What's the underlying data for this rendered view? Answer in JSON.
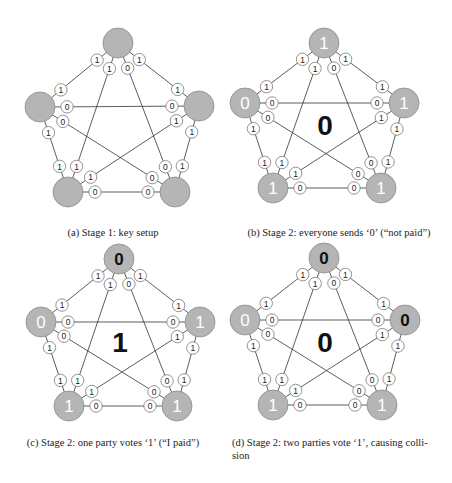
{
  "figure": {
    "node_fill": "#b5b5b5",
    "node_stroke": "#8a8a8a",
    "label_fill": "#ffffff",
    "label_stroke": "#777777",
    "line_color": "#333333",
    "edges": [
      {
        "from": "T",
        "to": "L",
        "label_from": "1",
        "label_to": "1"
      },
      {
        "from": "T",
        "to": "R",
        "label_from": "1",
        "label_to": "1"
      },
      {
        "from": "T",
        "to": "BL",
        "label_from": "1",
        "label_to": "1"
      },
      {
        "from": "T",
        "to": "BR",
        "label_from": "0",
        "label_to": "0"
      },
      {
        "from": "L",
        "to": "R",
        "label_from": "0",
        "label_to": "0"
      },
      {
        "from": "L",
        "to": "BL",
        "label_from": "1",
        "label_to": "1"
      },
      {
        "from": "L",
        "to": "BR",
        "label_from": "0",
        "label_to": "0"
      },
      {
        "from": "R",
        "to": "BL",
        "label_from": "1",
        "label_to": "1"
      },
      {
        "from": "R",
        "to": "BR",
        "label_from": "1",
        "label_to": "1"
      },
      {
        "from": "BL",
        "to": "BR",
        "label_from": "0",
        "label_to": "0"
      }
    ]
  },
  "panels": {
    "a": {
      "caption": "(a)  Stage 1: key setup",
      "center_value": "",
      "nodes": {
        "T": {
          "x": 118,
          "y": 43,
          "value": "",
          "dark": false
        },
        "L": {
          "x": 40,
          "y": 107,
          "value": "",
          "dark": false
        },
        "R": {
          "x": 199,
          "y": 106,
          "value": "",
          "dark": false
        },
        "BL": {
          "x": 68,
          "y": 192,
          "value": "",
          "dark": false
        },
        "BR": {
          "x": 175,
          "y": 192,
          "value": "",
          "dark": false
        }
      },
      "center": {
        "x": 119,
        "y": 125
      }
    },
    "b": {
      "caption": "(b)  Stage 2: everyone sends ‘0’ (“not paid”)",
      "center_value": "0",
      "nodes": {
        "T": {
          "x": 98,
          "y": 43,
          "value": "1",
          "dark": false
        },
        "L": {
          "x": 19,
          "y": 103,
          "value": "0",
          "dark": false
        },
        "R": {
          "x": 178,
          "y": 103,
          "value": "1",
          "dark": false
        },
        "BL": {
          "x": 47,
          "y": 188,
          "value": "1",
          "dark": false
        },
        "BR": {
          "x": 155,
          "y": 188,
          "value": "1",
          "dark": false
        }
      },
      "center": {
        "x": 99,
        "y": 125
      }
    },
    "c": {
      "caption": "(c)  Stage 2: one party votes ‘1’ (“I paid”)",
      "center_value": "1",
      "nodes": {
        "T": {
          "x": 119,
          "y": 19,
          "value": "0",
          "dark": true
        },
        "L": {
          "x": 41,
          "y": 82,
          "value": "0",
          "dark": false
        },
        "R": {
          "x": 200,
          "y": 82,
          "value": "1",
          "dark": false
        },
        "BL": {
          "x": 69,
          "y": 166,
          "value": "1",
          "dark": false
        },
        "BR": {
          "x": 177,
          "y": 166,
          "value": "1",
          "dark": false
        }
      },
      "center": {
        "x": 120,
        "y": 102
      }
    },
    "d": {
      "caption": "(d)  Stage 2: two parties vote ‘1’, causing colli-sion",
      "caption_line1": "(d)  Stage 2: two parties vote ‘1’, causing colli-",
      "caption_line2": "sion",
      "center_value": "0",
      "nodes": {
        "T": {
          "x": 98,
          "y": 18,
          "value": "0",
          "dark": true
        },
        "L": {
          "x": 19,
          "y": 80,
          "value": "0",
          "dark": false
        },
        "R": {
          "x": 179,
          "y": 80,
          "value": "0",
          "dark": true
        },
        "BL": {
          "x": 47,
          "y": 165,
          "value": "1",
          "dark": false
        },
        "BR": {
          "x": 156,
          "y": 165,
          "value": "1",
          "dark": false
        }
      },
      "center": {
        "x": 99,
        "y": 102
      }
    }
  }
}
